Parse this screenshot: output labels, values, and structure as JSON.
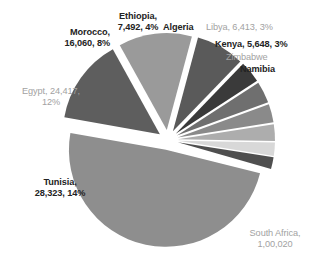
{
  "chart_data": {
    "type": "pie",
    "title": "",
    "exploded": true,
    "legend": "none",
    "label_format": "name, value, percent",
    "categories": [
      "South Africa",
      "Tunisia",
      "Egypt",
      "Morocco",
      "Ethiopia",
      "Algeria",
      "Libya",
      "Kenya",
      "Zimbabwe",
      "Namibia"
    ],
    "values": [
      100020,
      28323,
      24417,
      16060,
      7492,
      7100,
      6413,
      5648,
      5000,
      4600
    ],
    "percents": [
      49,
      14,
      12,
      8,
      4,
      3,
      3,
      3,
      2,
      2
    ],
    "colors": [
      "#8e8e8e",
      "#5e5e5e",
      "#9a9a9a",
      "#5a5a5a",
      "#3a3a3a",
      "#6f6f6f",
      "#8a8a8a",
      "#adadad",
      "#d8d8d8",
      "#4f4f4f"
    ],
    "slices": [
      {
        "name": "South Africa",
        "value_text": "1,00,020",
        "percent_text": "",
        "color": "#8e8e8e",
        "start_angle": 14,
        "end_angle": 190,
        "explode": 10
      },
      {
        "name": "Tunisia",
        "value_text": "28,323",
        "percent_text": "14%",
        "color": "#5e5e5e",
        "start_angle": 190,
        "end_angle": 241,
        "explode": 10
      },
      {
        "name": "Egypt",
        "value_text": "24,417",
        "percent_text": "12%",
        "color": "#9a9a9a",
        "start_angle": 241,
        "end_angle": 285,
        "explode": 10
      },
      {
        "name": "Morocco",
        "value_text": "16,060",
        "percent_text": "8%",
        "color": "#5a5a5a",
        "start_angle": 285,
        "end_angle": 314,
        "explode": 10
      },
      {
        "name": "Ethiopia",
        "value_text": "7,492",
        "percent_text": "4%",
        "color": "#3a3a3a",
        "start_angle": 314,
        "end_angle": 327,
        "explode": 10
      },
      {
        "name": "Algeria",
        "value_text": "",
        "percent_text": "",
        "color": "#6f6f6f",
        "start_angle": 327,
        "end_angle": 340,
        "explode": 10
      },
      {
        "name": "Libya",
        "value_text": "6,413",
        "percent_text": "3%",
        "color": "#8a8a8a",
        "start_angle": 340,
        "end_angle": 351,
        "explode": 10
      },
      {
        "name": "Kenya",
        "value_text": "5,648",
        "percent_text": "3%",
        "color": "#adadad",
        "start_angle": 351,
        "end_angle": 361,
        "explode": 10
      },
      {
        "name": "Zimbabwe",
        "value_text": "",
        "percent_text": "",
        "color": "#d8d8d8",
        "start_angle": 361,
        "end_angle": 369,
        "explode": 10
      },
      {
        "name": "Namibia",
        "value_text": "",
        "percent_text": "",
        "color": "#4f4f4f",
        "start_angle": 369,
        "end_angle": 376,
        "explode": 10
      }
    ]
  },
  "labels": {
    "morocco_line1": "Morocco,",
    "morocco_line2": "16,060, 8%",
    "ethiopia_line1": "Ethiopia,",
    "ethiopia_line2": "7,492, 4%",
    "algeria": "Algeria",
    "libya": "Libya, 6,413, 3%",
    "kenya": "Kenya, 5,648, 3%",
    "zimbabwe": "Zimbabwe",
    "namibia": "Namibia",
    "egypt_line1": "Egypt, 24,417,",
    "egypt_line2": "12%",
    "tunisia_line1": "Tunisia,",
    "tunisia_line2": "28,323, 14%",
    "southafrica_line1": "South Africa,",
    "southafrica_line2": "1,00,020"
  }
}
